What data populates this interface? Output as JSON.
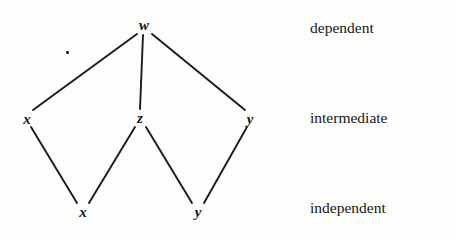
{
  "figure": {
    "background_color": "#fdfdfc",
    "ink_color": "#161616",
    "width": 456,
    "height": 239
  },
  "tier_labels": [
    {
      "id": "dependent",
      "text": "dependent",
      "x": 310,
      "y": 28
    },
    {
      "id": "intermediate",
      "text": "intermediate",
      "x": 310,
      "y": 118
    },
    {
      "id": "independent",
      "text": "independent",
      "x": 310,
      "y": 208
    }
  ],
  "nodes": [
    {
      "id": "w-dependent",
      "label": "w",
      "tier": "dependent",
      "x": 144,
      "y": 25
    },
    {
      "id": "x-intermediate",
      "label": "x",
      "tier": "intermediate",
      "x": 27,
      "y": 119
    },
    {
      "id": "z-intermediate",
      "label": "z",
      "tier": "intermediate",
      "x": 140,
      "y": 118
    },
    {
      "id": "y-intermediate",
      "label": "y",
      "tier": "intermediate",
      "x": 250,
      "y": 119
    },
    {
      "id": "x-independent",
      "label": "x",
      "tier": "independent",
      "x": 83,
      "y": 212
    },
    {
      "id": "y-independent",
      "label": "y",
      "tier": "independent",
      "x": 198,
      "y": 212
    }
  ],
  "edges": [
    {
      "id": "w-to-x",
      "from": "w-dependent",
      "to": "x-intermediate",
      "x1": 137,
      "y1": 34,
      "x2": 33,
      "y2": 110
    },
    {
      "id": "w-to-z",
      "from": "w-dependent",
      "to": "z-intermediate",
      "x1": 143,
      "y1": 35,
      "x2": 140,
      "y2": 109
    },
    {
      "id": "w-to-y",
      "from": "w-dependent",
      "to": "y-intermediate",
      "x1": 152,
      "y1": 34,
      "x2": 245,
      "y2": 110
    },
    {
      "id": "x-to-x",
      "from": "x-intermediate",
      "to": "x-independent",
      "x1": 31,
      "y1": 127,
      "x2": 77,
      "y2": 203
    },
    {
      "id": "z-to-x",
      "from": "z-intermediate",
      "to": "x-independent",
      "x1": 135,
      "y1": 127,
      "x2": 89,
      "y2": 203
    },
    {
      "id": "z-to-y",
      "from": "z-intermediate",
      "to": "y-independent",
      "x1": 146,
      "y1": 127,
      "x2": 192,
      "y2": 203
    },
    {
      "id": "y-to-y",
      "from": "y-intermediate",
      "to": "y-independent",
      "x1": 247,
      "y1": 127,
      "x2": 204,
      "y2": 203
    }
  ],
  "marks": [
    {
      "id": "stray-speck",
      "x": 66,
      "y": 51
    }
  ]
}
